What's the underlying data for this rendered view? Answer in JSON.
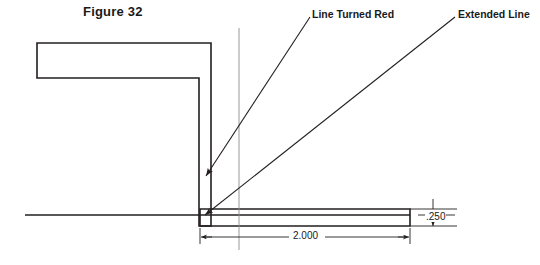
{
  "figure": {
    "title": "Figure 32"
  },
  "annotations": {
    "line_turned_red": "Line Turned Red",
    "extended_line": "Extended Line"
  },
  "dimensions": {
    "horizontal": "2.000",
    "vertical": ".250"
  },
  "style": {
    "line_color": "#231f20",
    "thin_line_color": "#8c8c8c",
    "background": "#ffffff"
  }
}
